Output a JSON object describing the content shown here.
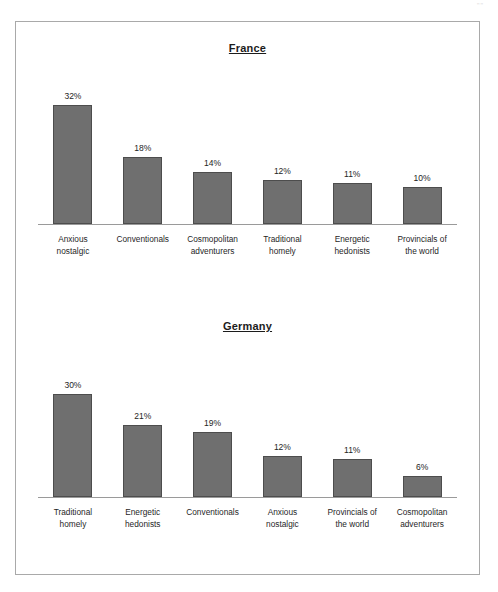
{
  "page": {
    "scan_mark": "\"\"",
    "frame_color": "#a9a9a9",
    "bar_fill": "#6f6f6f",
    "bar_stroke": "#4d4d4d",
    "axis_color": "#9a9a9a"
  },
  "chart_data": [
    {
      "type": "bar",
      "title": "France",
      "xlabel": "",
      "ylabel": "",
      "ylim": [
        0,
        34
      ],
      "grid": false,
      "legend": "none",
      "categories": [
        "Anxious nostalgic",
        "Conventionals",
        "Cosmopolitan adventurers",
        "Traditional homely",
        "Energetic hedonists",
        "Provincials of the world"
      ],
      "category_lines": [
        [
          "Anxious",
          "nostalgic"
        ],
        [
          "Conventionals",
          ""
        ],
        [
          "Cosmopolitan",
          "adventurers"
        ],
        [
          "Traditional",
          "homely"
        ],
        [
          "Energetic",
          "hedonists"
        ],
        [
          "Provincials of",
          "the world"
        ]
      ],
      "values": [
        32,
        18,
        14,
        12,
        11,
        10
      ],
      "value_labels": [
        "32%",
        "18%",
        "14%",
        "12%",
        "11%",
        "10%"
      ]
    },
    {
      "type": "bar",
      "title": "Germany",
      "xlabel": "",
      "ylabel": "",
      "ylim": [
        0,
        34
      ],
      "grid": false,
      "legend": "none",
      "categories": [
        "Traditional homely",
        "Energetic hedonists",
        "Conventionals",
        "Anxious nostalgic",
        "Provincials of the world",
        "Cosmopolitan adventurers"
      ],
      "category_lines": [
        [
          "Traditional",
          "homely"
        ],
        [
          "Energetic",
          "hedonists"
        ],
        [
          "Conventionals",
          ""
        ],
        [
          "Anxious",
          "nostalgic"
        ],
        [
          "Provincials of",
          "the world"
        ],
        [
          "Cosmopolitan",
          "adventurers"
        ]
      ],
      "values": [
        30,
        21,
        19,
        12,
        11,
        6
      ],
      "value_labels": [
        "30%",
        "21%",
        "19%",
        "12%",
        "11%",
        "6%"
      ]
    }
  ]
}
